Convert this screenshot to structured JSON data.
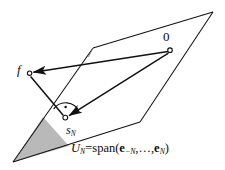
{
  "figure": {
    "kind": "geometry-diagram",
    "background_color": "#ffffff",
    "stroke_color": "#111111",
    "shade_color": "#b8b8b8",
    "labels": {
      "origin": "0",
      "function_point": "f",
      "projection_point": "s",
      "projection_subscript": "N",
      "subspace_symbol": "U",
      "subspace_subscript": "N",
      "equals": "=",
      "span_word": "span",
      "open_paren": "(",
      "basis_first": "e",
      "basis_first_subscript": "−N",
      "ellipsis": ",…,",
      "basis_last": "e",
      "basis_last_subscript": "N",
      "close_paren": ")",
      "subspace_full_text": "U_N = span(e_-N, ..., e_N)"
    },
    "points": {
      "origin": {
        "x": 170,
        "y": 50,
        "marker": "open-circle"
      },
      "f": {
        "x": 29.5,
        "y": 73,
        "marker": "open-circle"
      },
      "s_N": {
        "x": 65,
        "y": 117.5,
        "marker": "open-circle"
      }
    },
    "plane": {
      "name": "U_N",
      "vertices": [
        {
          "x": 93,
          "y": 48
        },
        {
          "x": 213,
          "y": 12
        },
        {
          "x": 140,
          "y": 122
        },
        {
          "x": 13,
          "y": 162
        }
      ]
    },
    "shaded_triangle": {
      "vertices": [
        {
          "x": 13,
          "y": 162
        },
        {
          "x": 43,
          "y": 117
        },
        {
          "x": 69,
          "y": 146
        }
      ]
    },
    "segments": [
      {
        "name": "origin-to-f",
        "arrow": true,
        "from": "origin",
        "to": "f"
      },
      {
        "name": "origin-to-sN",
        "arrow": true,
        "from": "origin",
        "to": "s_N"
      },
      {
        "name": "f-to-sN",
        "arrow": false,
        "from": "f",
        "to": "s_N"
      }
    ],
    "angle_marker": {
      "name": "right-angle-at-sN",
      "type": "arc-with-dot",
      "value_degrees": 90
    }
  }
}
